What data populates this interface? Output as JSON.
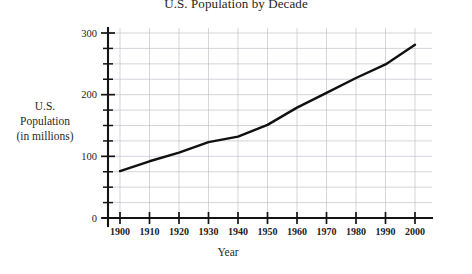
{
  "chart_data": {
    "type": "line",
    "title": "U.S. Population by Decade",
    "xlabel": "Year",
    "ylabel_lines": [
      "U.S.",
      "Population",
      "(in millions)"
    ],
    "ylabel": "U.S. Population (in millions)",
    "categories": [
      1900,
      1910,
      1920,
      1930,
      1940,
      1950,
      1960,
      1970,
      1980,
      1990,
      2000
    ],
    "values": [
      76,
      92,
      106,
      123,
      132,
      151,
      179,
      203,
      227,
      249,
      281
    ],
    "x": [
      1900,
      1910,
      1920,
      1930,
      1940,
      1950,
      1960,
      1970,
      1980,
      1990,
      2000
    ],
    "xtick_labels": [
      "1900",
      "1910",
      "1920",
      "1930",
      "1940",
      "1950",
      "1960",
      "1970",
      "1980",
      "1990",
      "2000"
    ],
    "ytick_labels": [
      "0",
      "100",
      "200",
      "300"
    ],
    "ytick_values": [
      0,
      100,
      200,
      300
    ],
    "yminor_step": 25,
    "xlim": [
      1895,
      2003
    ],
    "ylim": [
      0,
      310
    ],
    "grid": true,
    "grid_color": "#b9b9c4",
    "line_color": "#101010",
    "legend": false,
    "series": [
      {
        "name": "U.S. Population",
        "values": [
          76,
          92,
          106,
          123,
          132,
          151,
          179,
          203,
          227,
          249,
          281
        ]
      }
    ]
  }
}
